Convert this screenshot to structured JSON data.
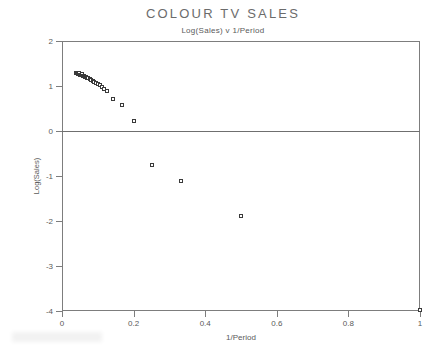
{
  "chart_data": {
    "type": "scatter",
    "title": "COLOUR TV SALES",
    "subtitle": "Log(Sales) v 1/Period",
    "xlabel": "1/Period",
    "ylabel": "Log(Sales)",
    "xlim": [
      0,
      1
    ],
    "ylim": [
      -4,
      2
    ],
    "xticks": [
      0,
      0.2,
      0.4,
      0.6,
      0.8,
      1
    ],
    "xticklabels": [
      "0",
      "0.2",
      "0.4",
      "0.6",
      "0.8",
      "1"
    ],
    "yticks": [
      2,
      1,
      0,
      -1,
      -2,
      -3,
      -4
    ],
    "yticklabels": [
      "2",
      "1",
      "0",
      "-1",
      "-2",
      "-3",
      "-4"
    ],
    "grid": false,
    "legend": null,
    "reference_lines": [
      {
        "axis": "y",
        "value": 0
      }
    ],
    "marker": "open-square",
    "marker_color": "#3a3a3a",
    "points": [
      {
        "x": 0.038,
        "y": 1.3
      },
      {
        "x": 0.042,
        "y": 1.28
      },
      {
        "x": 0.045,
        "y": 1.27
      },
      {
        "x": 0.048,
        "y": 1.29
      },
      {
        "x": 0.05,
        "y": 1.25
      },
      {
        "x": 0.053,
        "y": 1.24
      },
      {
        "x": 0.056,
        "y": 1.26
      },
      {
        "x": 0.059,
        "y": 1.22
      },
      {
        "x": 0.062,
        "y": 1.23
      },
      {
        "x": 0.065,
        "y": 1.2
      },
      {
        "x": 0.068,
        "y": 1.21
      },
      {
        "x": 0.071,
        "y": 1.18
      },
      {
        "x": 0.074,
        "y": 1.17
      },
      {
        "x": 0.078,
        "y": 1.15
      },
      {
        "x": 0.082,
        "y": 1.13
      },
      {
        "x": 0.086,
        "y": 1.12
      },
      {
        "x": 0.09,
        "y": 1.1
      },
      {
        "x": 0.095,
        "y": 1.07
      },
      {
        "x": 0.1,
        "y": 1.05
      },
      {
        "x": 0.105,
        "y": 1.02
      },
      {
        "x": 0.111,
        "y": 0.98
      },
      {
        "x": 0.118,
        "y": 0.93
      },
      {
        "x": 0.125,
        "y": 0.88
      },
      {
        "x": 0.143,
        "y": 0.72
      },
      {
        "x": 0.167,
        "y": 0.58
      },
      {
        "x": 0.2,
        "y": 0.22
      },
      {
        "x": 0.25,
        "y": -0.75
      },
      {
        "x": 0.333,
        "y": -1.12
      },
      {
        "x": 0.5,
        "y": -1.88
      },
      {
        "x": 1.0,
        "y": -3.97
      }
    ]
  }
}
